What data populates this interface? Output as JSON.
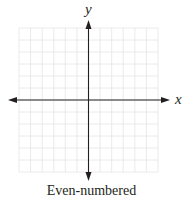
{
  "graph": {
    "x_axis_label": "x",
    "y_axis_label": "y",
    "caption": "Even-numbered",
    "grid": {
      "columns": 12,
      "rows": 12,
      "color": "#e6e6e6"
    },
    "axis_color": "#231f20"
  }
}
